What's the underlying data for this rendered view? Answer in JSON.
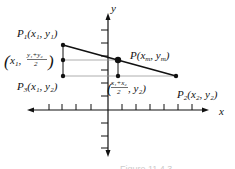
{
  "figure": {
    "axes": {
      "x_label": "x",
      "y_label": "y"
    },
    "points": {
      "p1": {
        "name": "P",
        "sub": "1",
        "coords": "(x₁, y₁)"
      },
      "pm": {
        "name": "P",
        "coords": "(x",
        "sub_m": "m",
        "mid": ", y",
        "sub_m2": "m",
        "close": ")"
      },
      "p2": {
        "name": "P",
        "sub": "2",
        "coords": "(x₂, y₂)"
      },
      "p3": {
        "name": "P",
        "sub": "3",
        "coords": "(x₁, y₂)"
      }
    },
    "left_mid": {
      "open": "(x",
      "sub": "1",
      "comma": ",",
      "numerator": "y₁+y₂",
      "denominator": "2",
      "close": ")"
    },
    "bottom_mid": {
      "open": "(",
      "numerator": "x₁+x₂",
      "denominator": "2",
      "rest": ", y₂)"
    },
    "caption": "Figure 11.4.3"
  },
  "colors": {
    "line": "#111111",
    "guide": "#9a9a9a",
    "background": "#ffffff"
  }
}
